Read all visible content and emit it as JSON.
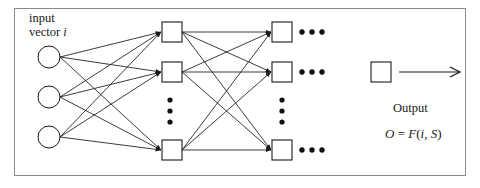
{
  "figure": {
    "kind": "neural-network-diagram",
    "frame": {
      "x": 14,
      "y": 8,
      "width": 452,
      "height": 168,
      "border_color": "#8a8a8a"
    },
    "stroke_color": "#1a1a1a",
    "background": "#ffffff"
  },
  "labels": {
    "input_line1": "input",
    "input_line2_prefix": "vector ",
    "input_line2_var": "i",
    "output_caption": "Output",
    "formula_lhs": "O",
    "formula_eq": " = ",
    "formula_fn": "F",
    "formula_open": "(",
    "formula_arg1": "i",
    "formula_comma": ", ",
    "formula_arg2": "S",
    "formula_close": ")"
  },
  "nodes": {
    "input_circles": [
      {
        "cx": 49,
        "cy": 57,
        "r": 11
      },
      {
        "cx": 49,
        "cy": 97,
        "r": 11
      },
      {
        "cx": 49,
        "cy": 137,
        "r": 11
      }
    ],
    "hidden_squares": [
      {
        "x": 162,
        "y": 22,
        "size": 20
      },
      {
        "x": 162,
        "y": 62,
        "size": 20
      },
      {
        "x": 162,
        "y": 140,
        "size": 20
      }
    ],
    "second_squares": [
      {
        "x": 272,
        "y": 22,
        "size": 20
      },
      {
        "x": 272,
        "y": 62,
        "size": 20
      },
      {
        "x": 272,
        "y": 140,
        "size": 20
      }
    ],
    "output_square": {
      "x": 371,
      "y": 62,
      "size": 20
    }
  },
  "ellipses": {
    "vertical_dots_hidden": {
      "cx": 170,
      "cys": [
        100,
        111,
        122
      ],
      "r": 2.6
    },
    "vertical_dots_second": {
      "cx": 282,
      "cys": [
        100,
        111,
        122
      ],
      "r": 2.6
    },
    "horizontal_dots_rows": [
      {
        "cy": 32,
        "cxs": [
          302,
          312,
          322
        ],
        "r": 2.6
      },
      {
        "cy": 72,
        "cxs": [
          302,
          312,
          322
        ],
        "r": 2.6
      },
      {
        "cy": 150,
        "cxs": [
          302,
          312,
          322
        ],
        "r": 2.6
      }
    ]
  },
  "output_arrow": {
    "x1": 399,
    "y1": 72,
    "x2": 461,
    "y2": 72
  }
}
